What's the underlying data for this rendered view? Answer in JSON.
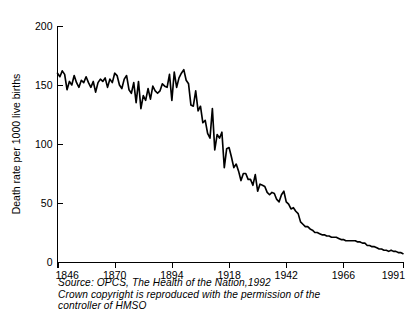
{
  "figure": {
    "background_color": "#ffffff",
    "line_color": "#000000"
  },
  "caption": {
    "line1": "Source: OPCS, The Health of the Nation,1992",
    "line2": "Crown copyright is reproduced with the permission of the",
    "line3": "controller of HMSO"
  },
  "bottom_fragment": {
    "text": ""
  },
  "chart_data": {
    "type": "line",
    "title": "",
    "subtitle": "",
    "xlabel": "",
    "ylabel": "Death rate per 1000 live births",
    "xlim": [
      1846,
      1991
    ],
    "ylim": [
      0,
      200
    ],
    "grid": false,
    "legend": false,
    "legend_position": "none",
    "xticks": [
      1846,
      1870,
      1894,
      1918,
      1942,
      1966,
      1991
    ],
    "xtick_labels": [
      "1846",
      "1870",
      "1894",
      "1918",
      "1942",
      "1966",
      "1991"
    ],
    "yticks": [
      0,
      50,
      100,
      150,
      200
    ],
    "ytick_labels": [
      "0",
      "50",
      "100",
      "150",
      "200"
    ],
    "series": [
      {
        "name": "Infant death rate per 1000 live births",
        "x": [
          1846,
          1847,
          1848,
          1849,
          1850,
          1851,
          1852,
          1853,
          1854,
          1855,
          1856,
          1857,
          1858,
          1859,
          1860,
          1861,
          1862,
          1863,
          1864,
          1865,
          1866,
          1867,
          1868,
          1869,
          1870,
          1871,
          1872,
          1873,
          1874,
          1875,
          1876,
          1877,
          1878,
          1879,
          1880,
          1881,
          1882,
          1883,
          1884,
          1885,
          1886,
          1887,
          1888,
          1889,
          1890,
          1891,
          1892,
          1893,
          1894,
          1895,
          1896,
          1897,
          1898,
          1899,
          1900,
          1901,
          1902,
          1903,
          1904,
          1905,
          1906,
          1907,
          1908,
          1909,
          1910,
          1911,
          1912,
          1913,
          1914,
          1915,
          1916,
          1917,
          1918,
          1919,
          1920,
          1921,
          1922,
          1923,
          1924,
          1925,
          1926,
          1927,
          1928,
          1929,
          1930,
          1931,
          1932,
          1933,
          1934,
          1935,
          1936,
          1937,
          1938,
          1939,
          1940,
          1941,
          1942,
          1943,
          1944,
          1945,
          1946,
          1947,
          1948,
          1949,
          1950,
          1951,
          1952,
          1953,
          1954,
          1955,
          1956,
          1957,
          1958,
          1959,
          1960,
          1961,
          1962,
          1963,
          1964,
          1965,
          1966,
          1967,
          1968,
          1969,
          1970,
          1971,
          1972,
          1973,
          1974,
          1975,
          1976,
          1977,
          1978,
          1979,
          1980,
          1981,
          1982,
          1983,
          1984,
          1985,
          1986,
          1987,
          1988,
          1989,
          1990,
          1991
        ],
        "values": [
          160,
          157,
          162,
          159,
          146,
          153,
          150,
          158,
          152,
          148,
          154,
          152,
          157,
          152,
          148,
          153,
          144,
          152,
          155,
          153,
          156,
          148,
          155,
          152,
          160,
          158,
          150,
          147,
          155,
          158,
          146,
          143,
          152,
          135,
          153,
          130,
          141,
          137,
          147,
          138,
          149,
          145,
          143,
          145,
          151,
          149,
          148,
          159,
          137,
          161,
          148,
          156,
          160,
          163,
          154,
          151,
          133,
          132,
          145,
          128,
          132,
          118,
          120,
          109,
          105,
          130,
          95,
          108,
          105,
          110,
          80,
          96,
          97,
          89,
          80,
          83,
          77,
          69,
          75,
          75,
          70,
          70,
          65,
          74,
          60,
          66,
          65,
          64,
          59,
          57,
          59,
          58,
          53,
          51,
          57,
          60,
          51,
          49,
          45,
          46,
          43,
          41,
          34,
          32,
          30,
          30,
          28,
          27,
          25,
          25,
          24,
          23,
          23,
          22,
          22,
          21,
          21,
          21,
          20,
          19,
          19,
          18,
          18,
          18,
          18,
          18,
          17,
          17,
          16,
          16,
          14,
          14,
          13,
          13,
          12,
          11,
          11,
          10,
          10,
          9,
          10,
          9,
          9,
          8,
          8,
          7
        ]
      }
    ]
  }
}
